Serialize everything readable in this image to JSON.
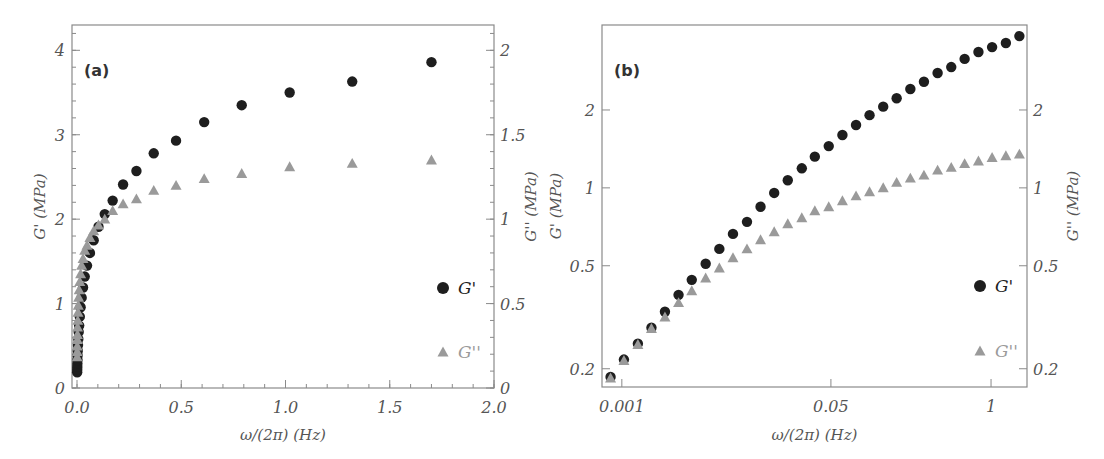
{
  "chart_data": [
    {
      "type": "scatter",
      "panel_label": "(a)",
      "xscale": "linear",
      "xlabel": "ω/(2π) (Hz)",
      "ylabel": "G' (MPa)",
      "ylabel_right": "G'' (MPa)",
      "xlim": [
        -0.024,
        2.0
      ],
      "ylim": [
        0,
        4.3
      ],
      "ylim_right": [
        0,
        2.15
      ],
      "xticks": [
        {
          "v": 0.0,
          "label": "0.0"
        },
        {
          "v": 0.5,
          "label": "0.5"
        },
        {
          "v": 1.0,
          "label": "1.0"
        },
        {
          "v": 1.5,
          "label": "1.5"
        },
        {
          "v": 2.0,
          "label": "2.0"
        }
      ],
      "xminor_step": 0.1,
      "yticks": [
        {
          "v": 0,
          "label": "0"
        },
        {
          "v": 1,
          "label": "1"
        },
        {
          "v": 2,
          "label": "2"
        },
        {
          "v": 3,
          "label": "3"
        },
        {
          "v": 4,
          "label": "4"
        }
      ],
      "yminor_step": 0.2,
      "yticks_right": [
        {
          "v": 0,
          "label": "0"
        },
        {
          "v": 0.5,
          "label": "0.5"
        },
        {
          "v": 1,
          "label": "1"
        },
        {
          "v": 1.5,
          "label": "1.5"
        },
        {
          "v": 2,
          "label": "2"
        }
      ],
      "yminor_step_right": 0.1,
      "grid": false,
      "legend": {
        "placement": "center-right",
        "entries": [
          {
            "label": "G'",
            "series": "G'"
          },
          {
            "label": "G''",
            "series": "G''"
          }
        ]
      },
      "x": [
        0.00081,
        0.00104,
        0.00135,
        0.00174,
        0.00224,
        0.00289,
        0.0037,
        0.0048,
        0.0062,
        0.008,
        0.0104,
        0.0134,
        0.0173,
        0.0223,
        0.029,
        0.037,
        0.048,
        0.062,
        0.08,
        0.103,
        0.133,
        0.171,
        0.221,
        0.285,
        0.368,
        0.475,
        0.61,
        0.79,
        1.02,
        1.32,
        1.7
      ],
      "series": [
        {
          "name": "G'",
          "axis": "left",
          "marker": "circle",
          "color": "#1e1e1e",
          "values": [
            0.186,
            0.217,
            0.25,
            0.288,
            0.332,
            0.386,
            0.441,
            0.509,
            0.581,
            0.664,
            0.739,
            0.845,
            0.956,
            1.07,
            1.19,
            1.32,
            1.45,
            1.6,
            1.75,
            1.91,
            2.06,
            2.22,
            2.41,
            2.57,
            2.78,
            2.93,
            3.15,
            3.35,
            3.5,
            3.63,
            3.86
          ]
        },
        {
          "name": "G''",
          "axis": "right",
          "marker": "triangle",
          "color": "#9a9a9a",
          "values": [
            0.184,
            0.215,
            0.248,
            0.286,
            0.317,
            0.36,
            0.4,
            0.448,
            0.49,
            0.537,
            0.581,
            0.63,
            0.676,
            0.726,
            0.766,
            0.815,
            0.845,
            0.891,
            0.931,
            0.965,
            1.0,
            1.05,
            1.09,
            1.12,
            1.17,
            1.2,
            1.24,
            1.27,
            1.31,
            1.33,
            1.35
          ]
        }
      ]
    },
    {
      "type": "scatter",
      "panel_label": "(b)",
      "xscale": "log",
      "yscale": "log",
      "xlabel": "ω/(2π) (Hz)",
      "ylabel": "G' (MPa)",
      "ylabel_right": "G'' (MPa)",
      "xlim": [
        0.00069,
        1.96
      ],
      "ylim": [
        0.17,
        4.26
      ],
      "ylim_right": [
        0.17,
        4.26
      ],
      "xticks": [
        {
          "v": 0.001,
          "label": "0.001"
        },
        {
          "v": 0.05,
          "label": "0.05"
        },
        {
          "v": 1,
          "label": "1"
        }
      ],
      "yticks": [
        {
          "v": 0.2,
          "label": "0.2"
        },
        {
          "v": 0.5,
          "label": "0.5"
        },
        {
          "v": 1,
          "label": "1"
        },
        {
          "v": 2,
          "label": "2"
        }
      ],
      "yticks_right": [
        {
          "v": 0.2,
          "label": "0.2"
        },
        {
          "v": 0.5,
          "label": "0.5"
        },
        {
          "v": 1,
          "label": "1"
        },
        {
          "v": 2,
          "label": "2"
        }
      ],
      "grid": false,
      "legend": {
        "placement": "center-right",
        "entries": [
          {
            "label": "G'",
            "series": "G'"
          },
          {
            "label": "G''",
            "series": "G''"
          }
        ]
      },
      "x": [
        0.00081,
        0.00104,
        0.00135,
        0.00174,
        0.00224,
        0.00289,
        0.0037,
        0.0048,
        0.0062,
        0.008,
        0.0104,
        0.0134,
        0.0173,
        0.0223,
        0.029,
        0.037,
        0.048,
        0.062,
        0.08,
        0.103,
        0.133,
        0.171,
        0.221,
        0.285,
        0.368,
        0.475,
        0.61,
        0.79,
        1.02,
        1.32,
        1.7
      ],
      "series": [
        {
          "name": "G'",
          "axis": "left",
          "marker": "circle",
          "color": "#1e1e1e",
          "values": [
            0.186,
            0.217,
            0.25,
            0.288,
            0.332,
            0.386,
            0.441,
            0.509,
            0.581,
            0.664,
            0.739,
            0.845,
            0.956,
            1.07,
            1.19,
            1.32,
            1.45,
            1.6,
            1.75,
            1.91,
            2.06,
            2.22,
            2.41,
            2.57,
            2.78,
            2.93,
            3.15,
            3.35,
            3.5,
            3.63,
            3.86
          ]
        },
        {
          "name": "G''",
          "axis": "right",
          "marker": "triangle",
          "color": "#9a9a9a",
          "values": [
            0.184,
            0.215,
            0.248,
            0.286,
            0.317,
            0.36,
            0.4,
            0.448,
            0.49,
            0.537,
            0.581,
            0.63,
            0.676,
            0.726,
            0.766,
            0.815,
            0.845,
            0.891,
            0.931,
            0.965,
            1.0,
            1.05,
            1.09,
            1.12,
            1.17,
            1.2,
            1.24,
            1.27,
            1.31,
            1.33,
            1.35
          ]
        }
      ]
    }
  ]
}
